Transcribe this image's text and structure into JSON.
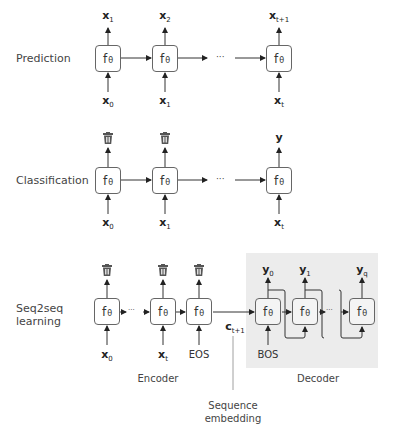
{
  "rows": {
    "prediction": {
      "label": "Prediction",
      "cell": "f",
      "cell_sub": "θ",
      "outputs": [
        {
          "base": "x",
          "sub": "1"
        },
        {
          "base": "x",
          "sub": "2"
        },
        {
          "base": "x",
          "sub": "t+1"
        }
      ],
      "inputs": [
        {
          "base": "x",
          "sub": "0"
        },
        {
          "base": "x",
          "sub": "1"
        },
        {
          "base": "x",
          "sub": "t"
        }
      ],
      "ellipsis": "···"
    },
    "classification": {
      "label": "Classification",
      "cell": "f",
      "cell_sub": "θ",
      "outputs": [
        {
          "type": "trash-icon"
        },
        {
          "type": "trash-icon"
        },
        {
          "base": "y",
          "sub": ""
        }
      ],
      "inputs": [
        {
          "base": "x",
          "sub": "0"
        },
        {
          "base": "x",
          "sub": "1"
        },
        {
          "base": "x",
          "sub": "t"
        }
      ],
      "ellipsis": "···"
    },
    "seq2seq": {
      "label_line1": "Seq2seq",
      "label_line2": "learning",
      "cell": "f",
      "cell_sub": "θ",
      "encoder": {
        "label": "Encoder",
        "inputs": [
          {
            "base": "x",
            "sub": "0"
          },
          {
            "base": "x",
            "sub": "t"
          },
          {
            "token": "EOS"
          }
        ],
        "outputs": [
          "trash-icon",
          "trash-icon",
          "trash-icon"
        ]
      },
      "context": {
        "base": "c",
        "sub": "t+1"
      },
      "decoder": {
        "label": "Decoder",
        "start_token": "BOS",
        "outputs": [
          {
            "base": "y",
            "sub": "0"
          },
          {
            "base": "y",
            "sub": "1"
          },
          {
            "base": "y",
            "sub": "q"
          }
        ],
        "background": "#ececec"
      },
      "annotation_line1": "Sequence",
      "annotation_line2": "embedding",
      "ellipsis": "···"
    }
  },
  "colors": {
    "line": "#333333",
    "box_border": "#666666",
    "decoder_bg": "#ececec"
  }
}
